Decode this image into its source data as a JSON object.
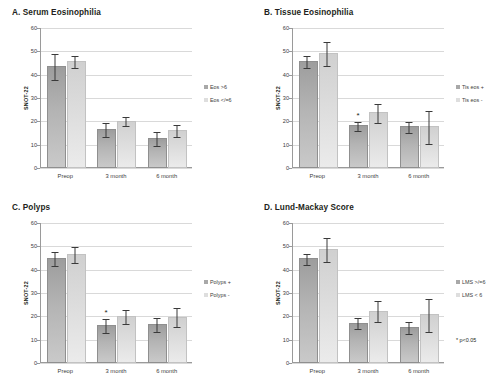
{
  "figure": {
    "y_axis_label": "SNOT-22",
    "y_ticks": [
      "0",
      "10",
      "20",
      "30",
      "40",
      "50",
      "60"
    ],
    "x_categories": [
      "Preop",
      "3 month",
      "6 month"
    ],
    "significance_marker": "*",
    "pvalue_note": "* p<0.05",
    "colors": {
      "bar_dark": "#a8a8a8",
      "bar_light": "#dedede",
      "grid": "#d9d9d9",
      "axis": "#9a9a9a",
      "text": "#231f20"
    }
  },
  "chart_data": [
    {
      "type": "bar",
      "panel": "A",
      "title": "A. Serum Eosinophilia",
      "xlabel": "",
      "ylabel": "SNOT-22",
      "ylim": [
        0,
        60
      ],
      "ytick_step": 10,
      "grid": true,
      "legend_position": "right",
      "categories": [
        "Preop",
        "3 month",
        "6 month"
      ],
      "series": [
        {
          "name": "Eos >6",
          "values": [
            43,
            16,
            12
          ],
          "errors": [
            5.5,
            3,
            3
          ],
          "significance": [
            null,
            null,
            null
          ]
        },
        {
          "name": "Eos </=6",
          "values": [
            45,
            19.5,
            15.5
          ],
          "errors": [
            2.5,
            2,
            2.5
          ],
          "significance": [
            null,
            null,
            null
          ]
        }
      ]
    },
    {
      "type": "bar",
      "panel": "B",
      "title": "B. Tissue Eosinophilia",
      "xlabel": "",
      "ylabel": "SNOT-22",
      "ylim": [
        0,
        60
      ],
      "ytick_step": 10,
      "grid": true,
      "legend_position": "right",
      "categories": [
        "Preop",
        "3 month",
        "6 month"
      ],
      "series": [
        {
          "name": "Tis eos +",
          "values": [
            45,
            17.5,
            17
          ],
          "errors": [
            2.5,
            2,
            2.5
          ],
          "significance": [
            null,
            "*",
            null
          ]
        },
        {
          "name": "Tis eos -",
          "values": [
            48.5,
            23,
            17
          ],
          "errors": [
            5,
            4,
            7
          ],
          "significance": [
            null,
            null,
            null
          ]
        }
      ]
    },
    {
      "type": "bar",
      "panel": "C",
      "title": "C. Polyps",
      "xlabel": "",
      "ylabel": "SNOT-22",
      "ylim": [
        0,
        60
      ],
      "ytick_step": 10,
      "grid": true,
      "legend_position": "right",
      "categories": [
        "Preop",
        "3 month",
        "6 month"
      ],
      "series": [
        {
          "name": "Polyps +",
          "values": [
            44,
            15.5,
            16
          ],
          "errors": [
            3,
            3,
            3
          ],
          "significance": [
            null,
            "*",
            null
          ]
        },
        {
          "name": "Polyps -",
          "values": [
            46,
            19.5,
            19
          ],
          "errors": [
            3.5,
            3,
            4
          ],
          "significance": [
            null,
            null,
            null
          ]
        }
      ]
    },
    {
      "type": "bar",
      "panel": "D",
      "title": "D. Lund-Mackay Score",
      "xlabel": "",
      "ylabel": "SNOT-22",
      "ylim": [
        0,
        60
      ],
      "ytick_step": 10,
      "grid": true,
      "legend_position": "right",
      "categories": [
        "Preop",
        "3 month",
        "6 month"
      ],
      "series": [
        {
          "name": "LMS >/=6",
          "values": [
            44,
            16.5,
            14.5
          ],
          "errors": [
            2.5,
            2.5,
            2.5
          ],
          "significance": [
            null,
            null,
            null
          ]
        },
        {
          "name": "LMS < 6",
          "values": [
            48,
            21.5,
            20
          ],
          "errors": [
            5,
            4.5,
            7
          ],
          "significance": [
            null,
            null,
            null
          ]
        }
      ]
    }
  ]
}
